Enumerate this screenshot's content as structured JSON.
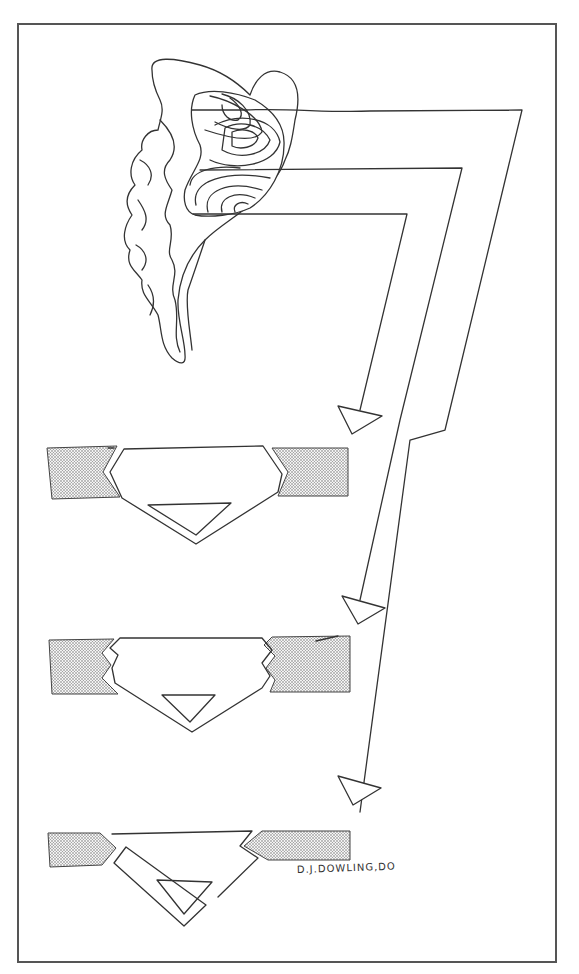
{
  "figure": {
    "kind": "hand-drawn anatomical diagram",
    "signature": "D.J.DOWLING,DO",
    "colors": {
      "ink": "#333333",
      "frame": "#555555",
      "stipple": "#8a8a8a",
      "background": "#ffffff"
    }
  },
  "structures": {
    "organ": {
      "label": "brain-like structure with contour map",
      "contour_centers": 3
    },
    "leader_lines": [
      {
        "from": "upper contour center",
        "to": "bottom wedge"
      },
      {
        "from": "middle contour center",
        "to": "middle wedge"
      },
      {
        "from": "lower contour center",
        "to": "top wedge"
      }
    ],
    "panels": [
      {
        "name": "panel-1",
        "joint_style": "angled notch",
        "marker": "triangle"
      },
      {
        "name": "panel-2",
        "joint_style": "zigzag notch",
        "marker": "triangle"
      },
      {
        "name": "panel-3",
        "joint_style": "pointed tip",
        "marker": "triangle"
      }
    ]
  }
}
